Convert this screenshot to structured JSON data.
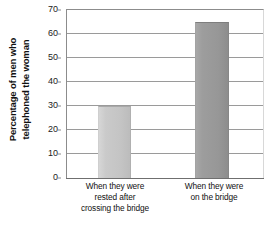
{
  "chart_data": {
    "type": "bar",
    "title": "",
    "subtitle": "",
    "xlabel": "",
    "ylabel": "Percentage of men who telephoned the woman",
    "ylabel_lines": [
      "Percentage of men who",
      "telephoned the woman"
    ],
    "categories": [
      "When they were rested after crossing the bridge",
      "When they were on the bridge"
    ],
    "category_lines": [
      [
        "When they were",
        "rested after",
        "crossing the bridge"
      ],
      [
        "When they were",
        "on the bridge"
      ]
    ],
    "values": [
      30,
      65
    ],
    "ylim": [
      0,
      70
    ],
    "ytick_step": 10,
    "yticks": [
      0,
      10,
      20,
      30,
      40,
      50,
      60,
      70
    ],
    "ytick_labels": [
      "0",
      "10",
      "20",
      "30",
      "40",
      "50",
      "60",
      "70"
    ],
    "grid": true,
    "grid_axis": "y",
    "legend": false,
    "legend_position": "none",
    "bar_colors": [
      "#c9c9c9",
      "#9a9a9a"
    ],
    "bar_edge_colors": [
      "#a9a9a9",
      "#7e7e7e"
    ],
    "axis_color": "#8c8c8c",
    "gridline_color": "#9a9a9a",
    "background_color": "#ffffff",
    "text_color": "#111111"
  }
}
